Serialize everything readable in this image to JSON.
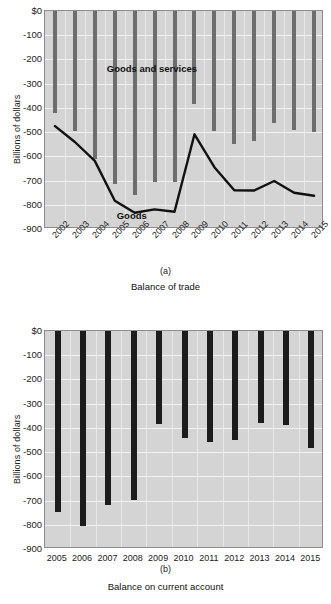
{
  "chart_data": [
    {
      "type": "bar",
      "panel": "(a)",
      "title": "Balance of trade",
      "xlabel": "",
      "ylabel": "Billions of dollars",
      "ylim": [
        -900,
        0
      ],
      "yticks": [
        0,
        -100,
        -200,
        -300,
        -400,
        -500,
        -600,
        -700,
        -800,
        -900
      ],
      "ytick_labels": [
        "$0",
        "-100",
        "-200",
        "-300",
        "-400",
        "-500",
        "-600",
        "-700",
        "-800",
        "-900"
      ],
      "grid": true,
      "legend": "none",
      "categories": [
        "2002",
        "2003",
        "2004",
        "2005",
        "2006",
        "2007",
        "2008",
        "2009",
        "2010",
        "2011",
        "2012",
        "2013",
        "2014",
        "2015"
      ],
      "series": [
        {
          "name": "Goods and services",
          "kind": "bar",
          "color": "#6d6d6d",
          "values": [
            -421,
            -497,
            -610,
            -714,
            -761,
            -705,
            -708,
            -384,
            -494,
            -548,
            -537,
            -461,
            -490,
            -500
          ]
        },
        {
          "name": "Goods",
          "kind": "line",
          "color": "#111111",
          "values": [
            -475,
            -541,
            -619,
            -783,
            -833,
            -819,
            -829,
            -509,
            -645,
            -740,
            -741,
            -702,
            -750,
            -763
          ]
        }
      ],
      "annotations": [
        {
          "text": "Goods and services",
          "x": 2004.6,
          "y": -238
        },
        {
          "text": "Goods",
          "x": 2005.1,
          "y": -845
        }
      ]
    },
    {
      "type": "bar",
      "panel": "(b)",
      "title": "Balance on current account",
      "xlabel": "",
      "ylabel": "Billions of dollars",
      "ylim": [
        -900,
        0
      ],
      "yticks": [
        0,
        -100,
        -200,
        -300,
        -400,
        -500,
        -600,
        -700,
        -800,
        -900
      ],
      "ytick_labels": [
        "$0",
        "-100",
        "-200",
        "-300",
        "-400",
        "-500",
        "-600",
        "-700",
        "-800",
        "-900"
      ],
      "grid": true,
      "legend": "none",
      "categories": [
        "2005",
        "2006",
        "2007",
        "2008",
        "2009",
        "2010",
        "2011",
        "2012",
        "2013",
        "2014",
        "2015"
      ],
      "series": [
        {
          "name": "Balance on current account",
          "kind": "bar",
          "color": "#1c1c1c",
          "values": [
            -748,
            -807,
            -719,
            -697,
            -384,
            -442,
            -460,
            -449,
            -379,
            -390,
            -485
          ]
        }
      ],
      "annotations": []
    }
  ],
  "figure_a": {
    "panel_id": "(a)",
    "caption": "Balance of trade",
    "ylabel": "Billions of dollars",
    "label_goods_services": "Goods and services",
    "label_goods": "Goods"
  },
  "figure_b": {
    "panel_id": "(b)",
    "caption": "Balance on current account",
    "ylabel": "Billions of dollars"
  }
}
